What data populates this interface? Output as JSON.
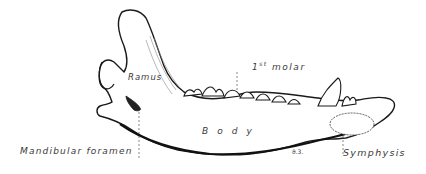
{
  "figure": {
    "labels": {
      "ramus": "Ramus",
      "first_molar_number": "1",
      "first_molar_suffix": "st",
      "first_molar_word": "molar",
      "body": "Body",
      "mandibular_foramen": "Mandibular foramen",
      "symphysis": "Symphysis",
      "signature": "ϑ.3."
    },
    "colors": {
      "ink": "#1a1a1a",
      "label": "#3a3a3a",
      "background": "#ffffff"
    }
  }
}
